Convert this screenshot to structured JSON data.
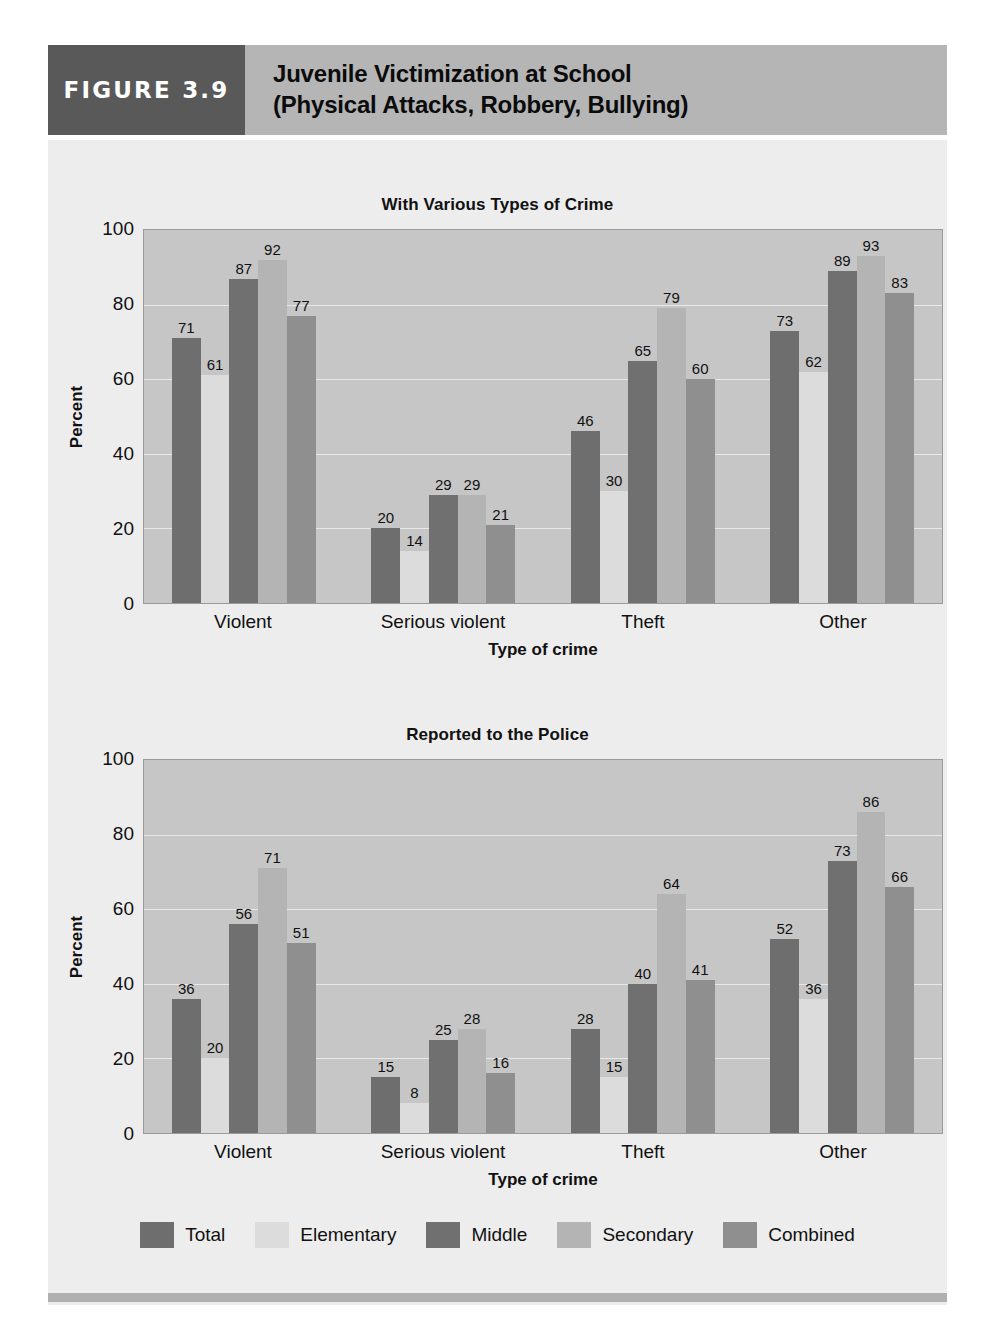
{
  "header": {
    "figure_tag": "FIGURE 3.9",
    "title_line1": "Juvenile Victimization at School",
    "title_line2": "(Physical Attacks, Robbery, Bullying)"
  },
  "legend": {
    "items": [
      {
        "label": "Total",
        "color": "#6e6e6e"
      },
      {
        "label": "Elementary",
        "color": "#dcdcdc"
      },
      {
        "label": "Middle",
        "color": "#707070"
      },
      {
        "label": "Secondary",
        "color": "#b4b4b4"
      },
      {
        "label": "Combined",
        "color": "#8f8f8f"
      }
    ]
  },
  "chart_data": [
    {
      "type": "bar",
      "title": "With Various Types of Crime",
      "xlabel": "Type of crime",
      "ylabel": "Percent",
      "ylim": [
        0,
        100
      ],
      "yticks": [
        0,
        20,
        40,
        60,
        80,
        100
      ],
      "grid": true,
      "legend_position": "bottom",
      "categories": [
        "Violent",
        "Serious violent",
        "Theft",
        "Other"
      ],
      "series": [
        {
          "name": "Total",
          "color": "#6e6e6e",
          "values": [
            71,
            20,
            46,
            73
          ]
        },
        {
          "name": "Elementary",
          "color": "#dcdcdc",
          "values": [
            61,
            14,
            30,
            62
          ]
        },
        {
          "name": "Middle",
          "color": "#707070",
          "values": [
            87,
            29,
            65,
            89
          ]
        },
        {
          "name": "Secondary",
          "color": "#b4b4b4",
          "values": [
            92,
            29,
            79,
            93
          ]
        },
        {
          "name": "Combined",
          "color": "#8f8f8f",
          "values": [
            77,
            21,
            60,
            83
          ]
        }
      ]
    },
    {
      "type": "bar",
      "title": "Reported to the Police",
      "xlabel": "Type of crime",
      "ylabel": "Percent",
      "ylim": [
        0,
        100
      ],
      "yticks": [
        0,
        20,
        40,
        60,
        80,
        100
      ],
      "grid": true,
      "legend_position": "bottom",
      "categories": [
        "Violent",
        "Serious violent",
        "Theft",
        "Other"
      ],
      "series": [
        {
          "name": "Total",
          "color": "#6e6e6e",
          "values": [
            36,
            15,
            28,
            52
          ]
        },
        {
          "name": "Elementary",
          "color": "#dcdcdc",
          "values": [
            20,
            8,
            15,
            36
          ]
        },
        {
          "name": "Middle",
          "color": "#707070",
          "values": [
            56,
            25,
            40,
            73
          ]
        },
        {
          "name": "Secondary",
          "color": "#b4b4b4",
          "values": [
            71,
            28,
            64,
            86
          ]
        },
        {
          "name": "Combined",
          "color": "#8f8f8f",
          "values": [
            51,
            16,
            41,
            66
          ]
        }
      ]
    }
  ]
}
